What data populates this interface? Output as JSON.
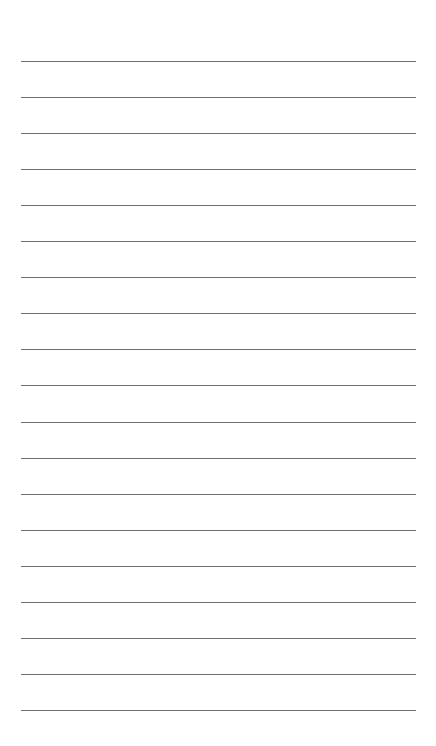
{
  "page": {
    "type": "lined paper",
    "background": "#ffffff",
    "line_color": "#6e6e6e",
    "line_count": 19,
    "first_line_y": 61,
    "line_spacing": 36.05
  }
}
